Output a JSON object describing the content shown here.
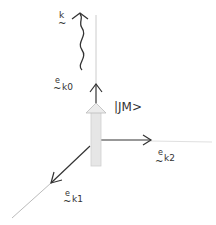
{
  "diagram": {
    "type": "vector-diagram",
    "labels": {
      "wave_vector": {
        "tilde": "~",
        "main": "k"
      },
      "e_k0": {
        "sup": "e",
        "tilde": "~",
        "sub": "k0"
      },
      "e_k1": {
        "sup": "e",
        "tilde": "~",
        "sub": "k1"
      },
      "e_k2": {
        "sup": "e",
        "tilde": "~",
        "sub": "k2"
      },
      "state_ket": "|JM>"
    },
    "colors": {
      "arrow": "#333333",
      "axis_faint": "#cccccc",
      "state_arrow_fill": "#e6e6e6",
      "state_arrow_stroke": "#bbbbbb"
    }
  }
}
